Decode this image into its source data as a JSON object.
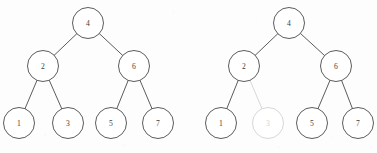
{
  "figure": {
    "background_color": "#fdfdfd",
    "stroke_color": "#4a4a4a",
    "dim_color": "#d2d2d2",
    "label_color": "#3d3d3d",
    "node_radius": 15.5
  },
  "chart_data": {
    "type": "diagram",
    "diagram_kind": "binary-tree-pair",
    "panels": [
      {
        "name": "left-tree",
        "caption": "",
        "nodes": [
          {
            "id": "L4",
            "label": "4",
            "x": 88,
            "y": 23,
            "state": "normal",
            "level": 0
          },
          {
            "id": "L2",
            "label": "2",
            "x": 43,
            "y": 66,
            "state": "normal",
            "level": 1
          },
          {
            "id": "L6",
            "label": "6",
            "x": 134,
            "y": 66,
            "state": "normal",
            "level": 1
          },
          {
            "id": "L1",
            "label": "1",
            "x": 19,
            "y": 123,
            "state": "normal",
            "level": 2
          },
          {
            "id": "L3",
            "label": "3",
            "x": 68,
            "y": 123,
            "state": "normal",
            "level": 2
          },
          {
            "id": "L5",
            "label": "5",
            "x": 111,
            "y": 123,
            "state": "normal",
            "level": 2
          },
          {
            "id": "L7",
            "label": "7",
            "x": 158,
            "y": 123,
            "state": "normal",
            "level": 2
          }
        ],
        "edges": [
          {
            "from": "L4",
            "to": "L2",
            "state": "normal"
          },
          {
            "from": "L4",
            "to": "L6",
            "state": "normal"
          },
          {
            "from": "L2",
            "to": "L1",
            "state": "normal"
          },
          {
            "from": "L2",
            "to": "L3",
            "state": "normal"
          },
          {
            "from": "L6",
            "to": "L5",
            "state": "normal"
          },
          {
            "from": "L6",
            "to": "L7",
            "state": "normal"
          }
        ]
      },
      {
        "name": "right-tree",
        "caption": "",
        "nodes": [
          {
            "id": "R4",
            "label": "4",
            "x": 289,
            "y": 23,
            "state": "normal",
            "level": 0
          },
          {
            "id": "R2",
            "label": "2",
            "x": 244,
            "y": 66,
            "state": "normal",
            "level": 1
          },
          {
            "id": "R6",
            "label": "6",
            "x": 336,
            "y": 66,
            "state": "normal",
            "level": 1
          },
          {
            "id": "R1",
            "label": "1",
            "x": 221,
            "y": 123,
            "state": "normal",
            "level": 2
          },
          {
            "id": "R3",
            "label": "3",
            "x": 268,
            "y": 123,
            "state": "dimmed",
            "level": 2
          },
          {
            "id": "R5",
            "label": "5",
            "x": 312,
            "y": 123,
            "state": "normal",
            "level": 2
          },
          {
            "id": "R7",
            "label": "7",
            "x": 358,
            "y": 123,
            "state": "normal",
            "level": 2
          }
        ],
        "edges": [
          {
            "from": "R4",
            "to": "R2",
            "state": "normal"
          },
          {
            "from": "R4",
            "to": "R6",
            "state": "normal"
          },
          {
            "from": "R2",
            "to": "R1",
            "state": "normal"
          },
          {
            "from": "R2",
            "to": "R3",
            "state": "dimmed"
          },
          {
            "from": "R6",
            "to": "R5",
            "state": "normal"
          },
          {
            "from": "R6",
            "to": "R7",
            "state": "normal"
          }
        ]
      }
    ]
  }
}
